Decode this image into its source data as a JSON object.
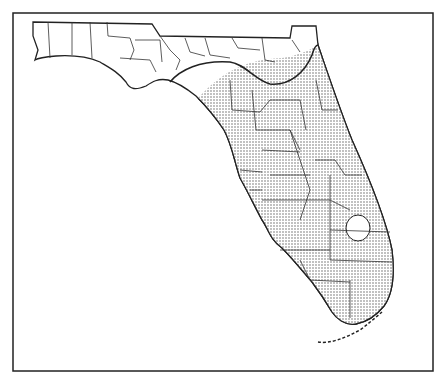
{
  "map": {
    "title": "",
    "region": "Florida",
    "subdivision": "counties",
    "legend": [],
    "fill_pattern": "stipple",
    "colors": {
      "background": "#ffffff",
      "line": "#222222",
      "stipple": "#555555"
    },
    "notes": "Stippled area covers peninsular Florida south of a curved boundary line across the Big Bend / north Florida; an unshaded area around Lake Okeechobee."
  }
}
